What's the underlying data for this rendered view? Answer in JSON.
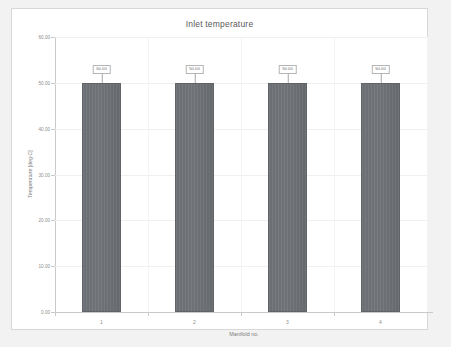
{
  "chart_data": {
    "type": "bar",
    "title": "Inlet temperature",
    "xlabel": "Manifold no.",
    "ylabel": "Temperature [deg-C]",
    "categories": [
      "1",
      "2",
      "3",
      "4"
    ],
    "values": [
      50.0,
      50.0,
      50.0,
      50.0
    ],
    "data_labels": [
      "50.00",
      "50.00",
      "50.00",
      "50.00"
    ],
    "ylim": [
      0,
      60
    ],
    "y_ticks": [
      60.0,
      50.0,
      40.0,
      30.0,
      20.0,
      10.0,
      0.0
    ],
    "y_tick_labels": [
      "60.00",
      "50.00",
      "40.00",
      "30.00",
      "20.00",
      "10.00",
      "0.00"
    ],
    "grid": true,
    "legend": null,
    "series": [
      {
        "name": "Inlet temperature",
        "values": [
          50.0,
          50.0,
          50.0,
          50.0
        ]
      }
    ],
    "colors": {
      "bar_fill": "#6f7377",
      "bar_border": "#5f6367",
      "gridline": "#f0f0f0",
      "axis_line": "#c9c9c9",
      "tick_text": "#8d8d8d",
      "title_text": "#5a5a5a",
      "axis_title_text": "#7d7d7d",
      "card_background": "#ffffff",
      "card_border": "#d8d8d8",
      "page_background": "#f2f2f2",
      "label_box_border": "#b5b5b5"
    }
  }
}
